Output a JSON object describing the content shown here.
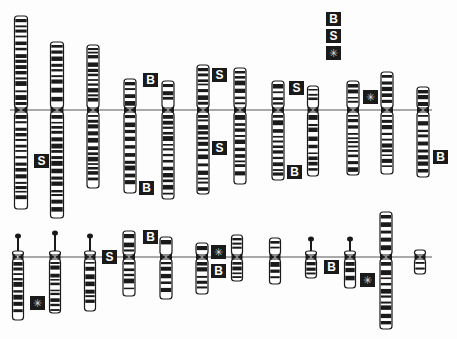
{
  "diagram": {
    "type": "karyotype-ideogram",
    "legend": [
      {
        "symbol": "B",
        "x": 326,
        "y": 12
      },
      {
        "symbol": "S",
        "x": 326,
        "y": 29
      },
      {
        "symbol": "*",
        "x": 326,
        "y": 46
      }
    ],
    "rows": [
      {
        "centromere_y": 110,
        "line": {
          "x1": 10,
          "x2": 432
        },
        "chromosomes": [
          {
            "x": 21,
            "top": 16,
            "bottom": 209,
            "width": 13
          },
          {
            "x": 57,
            "top": 42,
            "bottom": 218,
            "width": 13
          },
          {
            "x": 93,
            "top": 45,
            "bottom": 188,
            "width": 12
          },
          {
            "x": 130,
            "top": 79,
            "bottom": 193,
            "width": 12
          },
          {
            "x": 168,
            "top": 81,
            "bottom": 199,
            "width": 12
          },
          {
            "x": 203,
            "top": 65,
            "bottom": 194,
            "width": 12
          },
          {
            "x": 240,
            "top": 68,
            "bottom": 184,
            "width": 12
          },
          {
            "x": 278,
            "top": 81,
            "bottom": 180,
            "width": 12
          },
          {
            "x": 313,
            "top": 86,
            "bottom": 176,
            "width": 11
          },
          {
            "x": 353,
            "top": 81,
            "bottom": 175,
            "width": 12
          },
          {
            "x": 387,
            "top": 72,
            "bottom": 174,
            "width": 12
          },
          {
            "x": 423,
            "top": 87,
            "bottom": 177,
            "width": 12
          }
        ],
        "markers": [
          {
            "symbol": "B",
            "x": 143,
            "y": 73
          },
          {
            "symbol": "B",
            "x": 139,
            "y": 181
          },
          {
            "symbol": "S",
            "x": 34,
            "y": 154
          },
          {
            "symbol": "S",
            "x": 212,
            "y": 68
          },
          {
            "symbol": "S",
            "x": 212,
            "y": 141
          },
          {
            "symbol": "S",
            "x": 289,
            "y": 81
          },
          {
            "symbol": "B",
            "x": 287,
            "y": 165
          },
          {
            "symbol": "*",
            "x": 363,
            "y": 90
          },
          {
            "symbol": "B",
            "x": 433,
            "y": 150
          }
        ]
      },
      {
        "centromere_y": 257,
        "line": {
          "x1": 18,
          "x2": 432
        },
        "chromosomes": [
          {
            "x": 18,
            "top": 243,
            "bottom": 320,
            "width": 11,
            "acrocentric": true
          },
          {
            "x": 55,
            "top": 240,
            "bottom": 313,
            "width": 11,
            "acrocentric": true
          },
          {
            "x": 90,
            "top": 243,
            "bottom": 311,
            "width": 11,
            "acrocentric": true
          },
          {
            "x": 129,
            "top": 231,
            "bottom": 296,
            "width": 12
          },
          {
            "x": 166,
            "top": 237,
            "bottom": 299,
            "width": 12
          },
          {
            "x": 202,
            "top": 243,
            "bottom": 294,
            "width": 12
          },
          {
            "x": 237,
            "top": 235,
            "bottom": 281,
            "width": 11
          },
          {
            "x": 275,
            "top": 238,
            "bottom": 284,
            "width": 11
          },
          {
            "x": 311,
            "top": 246,
            "bottom": 278,
            "width": 11,
            "acrocentric": true
          },
          {
            "x": 350,
            "top": 246,
            "bottom": 288,
            "width": 11,
            "acrocentric": true
          },
          {
            "x": 386,
            "top": 212,
            "bottom": 329,
            "width": 12
          },
          {
            "x": 420,
            "top": 250,
            "bottom": 274,
            "width": 11
          }
        ],
        "markers": [
          {
            "symbol": "*",
            "x": 30,
            "y": 296
          },
          {
            "symbol": "S",
            "x": 102,
            "y": 250
          },
          {
            "symbol": "B",
            "x": 143,
            "y": 230
          },
          {
            "symbol": "*",
            "x": 211,
            "y": 245
          },
          {
            "symbol": "B",
            "x": 211,
            "y": 264
          },
          {
            "symbol": "B",
            "x": 324,
            "y": 260
          },
          {
            "symbol": "*",
            "x": 360,
            "y": 273
          }
        ]
      }
    ],
    "colors": {
      "chromosome_outline": "#1a1a1a",
      "band_dark": "#1a1a1a",
      "band_light": "#ffffff",
      "centromere_line": "#555555",
      "marker_bg": "#1a1a1a",
      "marker_text": "#ffffff"
    }
  }
}
